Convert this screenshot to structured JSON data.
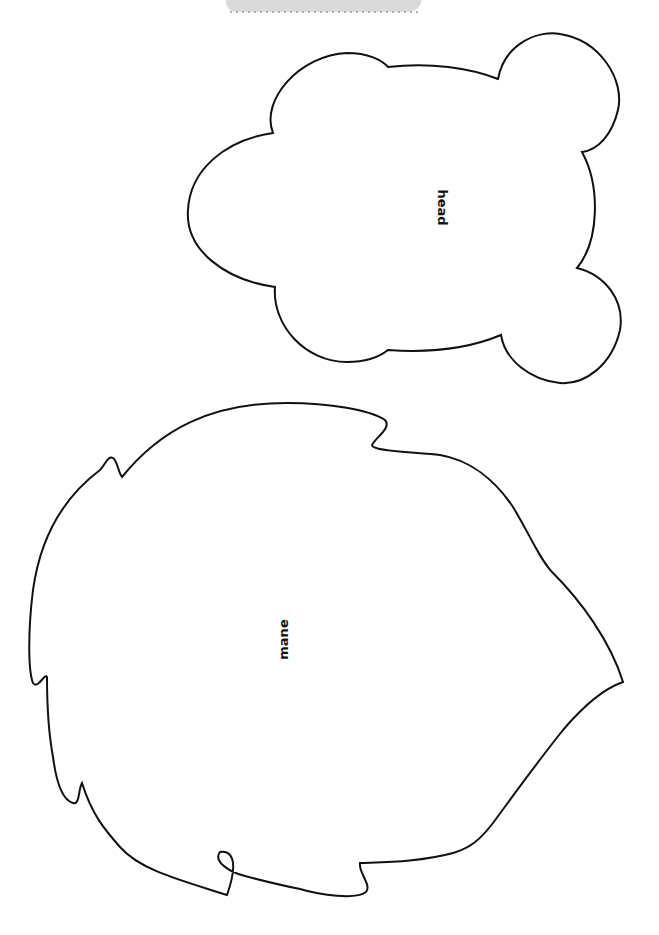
{
  "document": {
    "type": "printable craft template",
    "pieces": [
      {
        "id": "head",
        "label": "head",
        "orientation": "rotated 90deg clockwise"
      },
      {
        "id": "mane",
        "label": "mane",
        "orientation": "rotated 90deg counter-clockwise"
      }
    ],
    "colors": {
      "outline": "#111111",
      "background": "#ffffff",
      "banner": "#dadada"
    }
  }
}
